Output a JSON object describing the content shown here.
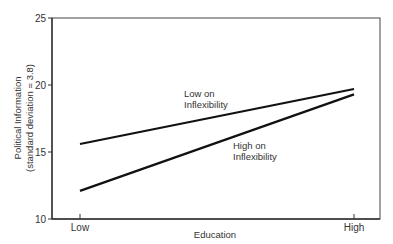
{
  "chart_data": {
    "type": "line",
    "title": "",
    "xlabel": "Education",
    "ylabel": "Political Information",
    "ylabel_sub": "(standard deviation = 3.8)",
    "categories": [
      "Low",
      "High"
    ],
    "ylim": [
      10,
      25
    ],
    "yticks": [
      10,
      15,
      20,
      25
    ],
    "grid": false,
    "legend_position": "inline annotations",
    "series": [
      {
        "name": "Low on Inflexibility",
        "label_line1": "Low on",
        "label_line2": "Inflexibility",
        "values": [
          15.6,
          19.7
        ]
      },
      {
        "name": "High on Inflexibility",
        "label_line1": "High on",
        "label_line2": "Inflexibility",
        "values": [
          12.1,
          19.3
        ]
      }
    ]
  }
}
